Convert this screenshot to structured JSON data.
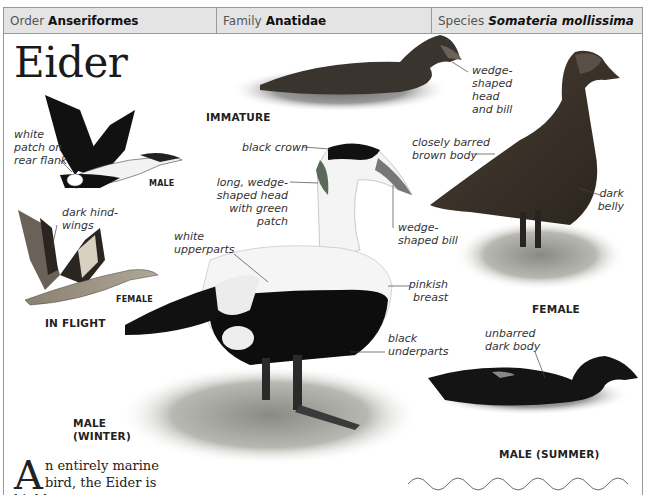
{
  "taxonomy": {
    "order": {
      "label": "Order",
      "value": "Anseriformes"
    },
    "family": {
      "label": "Family",
      "value": "Anatidae"
    },
    "species": {
      "label": "Species",
      "value": "Somateria mollissima"
    }
  },
  "title": "Eider",
  "figures": {
    "flight_male": {
      "label": "MALE",
      "annotations": [
        "white patch on rear flank"
      ]
    },
    "flight_female": {
      "label": "FEMALE",
      "annotations": [
        "dark hind-wings"
      ]
    },
    "in_flight_label": "IN FLIGHT",
    "immature": {
      "label": "IMMATURE",
      "annotations": [
        "wedge-shaped head and bill"
      ]
    },
    "male_winter": {
      "label": "MALE (WINTER)",
      "annotations": [
        "black crown",
        "long, wedge-shaped head with green patch",
        "wedge-shaped bill",
        "white upperparts",
        "pinkish breast",
        "black underparts"
      ]
    },
    "female": {
      "label": "FEMALE",
      "annotations": [
        "closely barred brown body",
        "dark belly"
      ]
    },
    "male_summer": {
      "label": "MALE (SUMMER)",
      "annotations": [
        "unbarred dark body"
      ]
    }
  },
  "captions": {
    "white_patch": [
      "white",
      "patch on",
      "rear flank"
    ],
    "dark_hindwings": [
      "dark hind-",
      "wings"
    ],
    "wedge_head_bill": [
      "wedge-",
      "shaped",
      "head",
      "and bill"
    ],
    "black_crown": "black crown",
    "long_wedge_head": [
      "long, wedge-",
      "shaped head",
      "with green patch"
    ],
    "wedge_bill": [
      "wedge-",
      "shaped bill"
    ],
    "white_upperparts": [
      "white",
      "upperparts"
    ],
    "pinkish_breast": [
      "pinkish",
      "breast"
    ],
    "black_underparts": [
      "black",
      "underparts"
    ],
    "closely_barred": [
      "closely barred",
      "brown body"
    ],
    "dark_belly": [
      "dark",
      "belly"
    ],
    "unbarred_dark": [
      "unbarred",
      "dark body"
    ]
  },
  "labels": {
    "male_flight": "MALE",
    "female_flight": "FEMALE",
    "in_flight": "IN FLIGHT",
    "immature": "IMMATURE",
    "male_winter_1": "MALE",
    "male_winter_2": "(WINTER)",
    "female": "FEMALE",
    "male_summer": "MALE (SUMMER)"
  },
  "body": {
    "drop_cap": "A",
    "line1": "n entirely marine",
    "line2": "bird, the Eider is highly"
  },
  "colors": {
    "header_bg": "#e4e4e4",
    "border": "#9a9a9a",
    "text": "#222222"
  }
}
